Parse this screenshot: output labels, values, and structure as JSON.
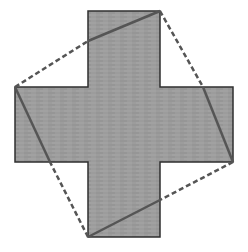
{
  "diagram": {
    "colors": {
      "background": "#ffffff",
      "cross_fill": "#9a9a9a",
      "cross_stroke": "#2f2f2f",
      "hatch": "#8a8a8a",
      "square_line": "#555555"
    },
    "cross": {
      "points": "88,11 160,11 160,87 233,87 233,162 160,162 160,237 88,237 88,162 15,162 15,87 88,87"
    },
    "square": {
      "vertices": [
        [
          160,
          11
        ],
        [
          233,
          162
        ],
        [
          88,
          237
        ],
        [
          15,
          87
        ]
      ],
      "segments": [
        {
          "name": "top-left-solid",
          "x1": 88,
          "y1": 41,
          "x2": 160,
          "y2": 11,
          "style": "solid"
        },
        {
          "name": "top-left-dashed",
          "x1": 15,
          "y1": 87,
          "x2": 88,
          "y2": 41,
          "style": "dashed"
        },
        {
          "name": "top-right-dashed",
          "x1": 160,
          "y1": 11,
          "x2": 203,
          "y2": 87,
          "style": "dashed"
        },
        {
          "name": "top-right-solid",
          "x1": 203,
          "y1": 87,
          "x2": 233,
          "y2": 162,
          "style": "solid"
        },
        {
          "name": "bottom-right-dashed",
          "x1": 233,
          "y1": 162,
          "x2": 160,
          "y2": 200,
          "style": "dashed"
        },
        {
          "name": "bottom-right-solid",
          "x1": 160,
          "y1": 200,
          "x2": 88,
          "y2": 237,
          "style": "solid"
        },
        {
          "name": "bottom-left-dashed",
          "x1": 88,
          "y1": 237,
          "x2": 50,
          "y2": 162,
          "style": "dashed"
        },
        {
          "name": "bottom-left-solid",
          "x1": 50,
          "y1": 162,
          "x2": 15,
          "y2": 87,
          "style": "solid"
        }
      ]
    }
  }
}
